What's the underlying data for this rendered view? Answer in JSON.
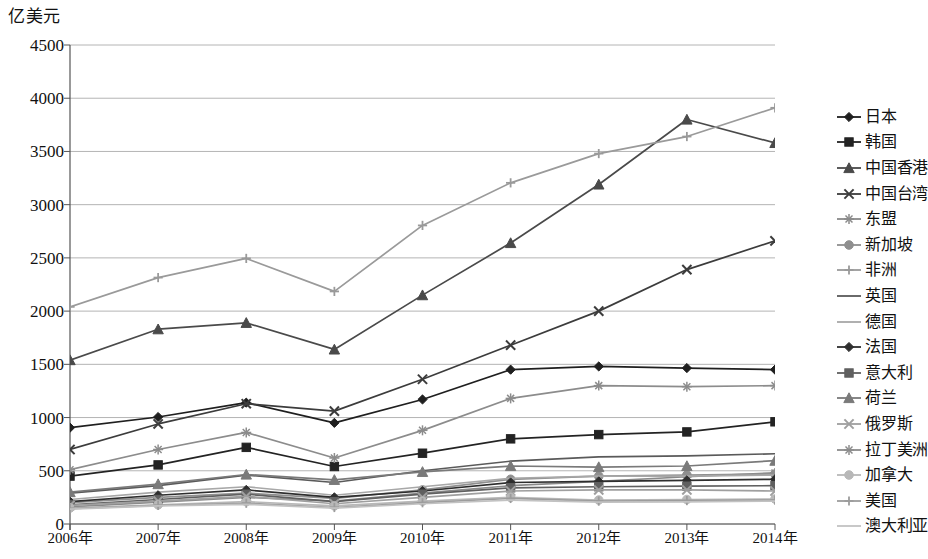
{
  "chart_data": {
    "type": "line",
    "title": "",
    "ylabel": "亿美元",
    "xlabel": "",
    "ylim": [
      0,
      4500
    ],
    "ytick_values": [
      0,
      500,
      1000,
      1500,
      2000,
      2500,
      3000,
      3500,
      4000,
      4500
    ],
    "ytick_labels": [
      "0",
      "500",
      "1000",
      "1500",
      "2000",
      "2500",
      "3000",
      "3500",
      "4000",
      "4500"
    ],
    "categories": [
      "2006年",
      "2007年",
      "2008年",
      "2009年",
      "2010年",
      "2011年",
      "2012年",
      "2013年",
      "2014年"
    ],
    "grid": true,
    "legend_position": "right",
    "series": [
      {
        "name": "日本",
        "marker": "diamond",
        "color": "#1f1f1f",
        "values": [
          905,
          1005,
          1140,
          950,
          1170,
          1450,
          1480,
          1465,
          1450
        ]
      },
      {
        "name": "韩国",
        "marker": "square",
        "color": "#232323",
        "values": [
          450,
          555,
          720,
          540,
          665,
          800,
          840,
          865,
          960
        ]
      },
      {
        "name": "中国香港",
        "marker": "triangle",
        "color": "#4a4a4a",
        "values": [
          1540,
          1830,
          1890,
          1640,
          2150,
          2640,
          3190,
          3800,
          3580
        ]
      },
      {
        "name": "中国台湾",
        "marker": "cross-x",
        "color": "#3c3c3c",
        "values": [
          700,
          940,
          1130,
          1060,
          1360,
          1680,
          2000,
          2390,
          2660
        ]
      },
      {
        "name": "东盟",
        "marker": "star",
        "color": "#8a8a8a",
        "values": [
          160,
          205,
          250,
          215,
          290,
          360,
          400,
          444,
          480
        ]
      },
      {
        "name": "新加坡",
        "marker": "circle",
        "color": "#8f8f8f",
        "values": [
          200,
          250,
          290,
          240,
          320,
          420,
          450,
          460,
          470
        ]
      },
      {
        "name": "非洲",
        "marker": "plus",
        "color": "#9a9a9a",
        "values": [
          2040,
          2315,
          2495,
          2185,
          2805,
          3205,
          3480,
          3640,
          3910
        ]
      },
      {
        "name": "英国",
        "marker": "none",
        "color": "#5a5a5a",
        "values": [
          290,
          360,
          460,
          390,
          500,
          590,
          630,
          640,
          660
        ]
      },
      {
        "name": "德国",
        "marker": "none",
        "color": "#a8a8a8",
        "values": [
          230,
          300,
          350,
          270,
          350,
          430,
          450,
          450,
          460
        ]
      },
      {
        "name": "法国",
        "marker": "diamond2",
        "color": "#2e2e2e",
        "values": [
          210,
          270,
          320,
          250,
          310,
          390,
          400,
          410,
          420
        ]
      },
      {
        "name": "意大利",
        "marker": "square2",
        "color": "#606060",
        "values": [
          180,
          230,
          280,
          210,
          280,
          340,
          350,
          355,
          360
        ]
      },
      {
        "name": "荷兰",
        "marker": "triangle2",
        "color": "#7a7a7a",
        "values": [
          300,
          375,
          465,
          415,
          490,
          545,
          535,
          545,
          595
        ]
      },
      {
        "name": "俄罗斯",
        "marker": "cross-x2",
        "color": "#9f9f9f",
        "values": [
          175,
          215,
          260,
          190,
          250,
          310,
          320,
          320,
          310
        ]
      },
      {
        "name": "拉丁美洲",
        "marker": "star2",
        "color": "#8c8c8c",
        "values": [
          510,
          700,
          860,
          620,
          880,
          1180,
          1300,
          1290,
          1300
        ]
      },
      {
        "name": "加拿大",
        "marker": "circle2",
        "color": "#b8b8b8",
        "values": [
          150,
          180,
          210,
          170,
          215,
          250,
          225,
          230,
          235
        ]
      },
      {
        "name": "美国",
        "marker": "plus2",
        "color": "#9c9c9c",
        "values": [
          145,
          175,
          195,
          155,
          200,
          240,
          215,
          220,
          225
        ]
      },
      {
        "name": "澳大利亚",
        "marker": "none2",
        "color": "#c2c2c2",
        "values": [
          140,
          170,
          185,
          150,
          190,
          225,
          205,
          208,
          215
        ]
      }
    ]
  },
  "legend": {
    "items": [
      {
        "label": "日本"
      },
      {
        "label": "韩国"
      },
      {
        "label": "中国香港"
      },
      {
        "label": "中国台湾"
      },
      {
        "label": "东盟"
      },
      {
        "label": "新加坡"
      },
      {
        "label": "非洲"
      },
      {
        "label": "英国"
      },
      {
        "label": "德国"
      },
      {
        "label": "法国"
      },
      {
        "label": "意大利"
      },
      {
        "label": "荷兰"
      },
      {
        "label": "俄罗斯"
      },
      {
        "label": "拉丁美洲"
      },
      {
        "label": "加拿大"
      },
      {
        "label": "美国"
      },
      {
        "label": "澳大利亚"
      }
    ]
  }
}
